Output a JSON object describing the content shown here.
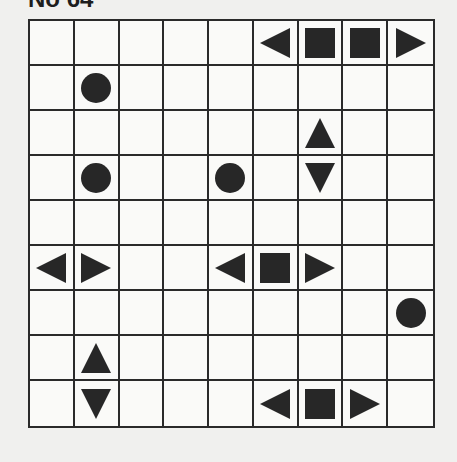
{
  "title": "No 64",
  "grid": {
    "rows": 9,
    "cols": 9,
    "cells": [
      [
        "",
        "",
        "",
        "",
        "",
        "left",
        "square",
        "square",
        "right"
      ],
      [
        "",
        "circle",
        "",
        "",
        "",
        "",
        "",
        "",
        ""
      ],
      [
        "",
        "",
        "",
        "",
        "",
        "",
        "up",
        "",
        ""
      ],
      [
        "",
        "circle",
        "",
        "",
        "circle",
        "",
        "down",
        "",
        ""
      ],
      [
        "",
        "",
        "",
        "",
        "",
        "",
        "",
        "",
        ""
      ],
      [
        "left",
        "right",
        "",
        "",
        "left",
        "square",
        "right",
        "",
        ""
      ],
      [
        "",
        "",
        "",
        "",
        "",
        "",
        "",
        "",
        "circle"
      ],
      [
        "",
        "up",
        "",
        "",
        "",
        "",
        "",
        "",
        ""
      ],
      [
        "",
        "down",
        "",
        "",
        "",
        "left",
        "square",
        "right",
        ""
      ]
    ]
  },
  "colors": {
    "shape": "#272727",
    "line": "#2a2a2a",
    "background": "#f0f0ee",
    "cell": "#fafaf8"
  }
}
